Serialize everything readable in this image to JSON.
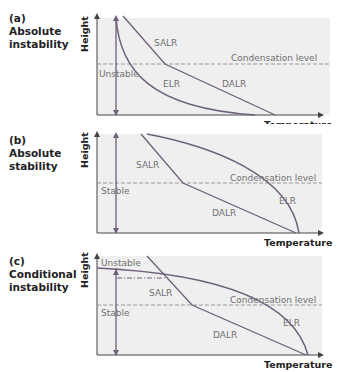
{
  "panels": [
    {
      "id": "a",
      "letter": "(a)",
      "title_line1": "Absolute",
      "title_line2": "instability",
      "region_label": "Unstable"
    },
    {
      "id": "b",
      "letter": "(b)",
      "title_line1": "Absolute",
      "title_line2": "stability",
      "region_label": "Stable"
    },
    {
      "id": "c",
      "letter": "(c)",
      "title_line1": "Conditional",
      "title_line2": "instability",
      "region_label_top": "Unstable",
      "region_label": "Stable"
    }
  ],
  "axes": {
    "y_label": "Height",
    "x_label": "Temperature"
  },
  "lines": {
    "salr": "SALR",
    "dalr": "DALR",
    "elr": "ELR",
    "condensation": "Condensation level"
  },
  "colors": {
    "line": "#6e5f7a",
    "plot_bg": "#efefef",
    "dashed": "#999999",
    "text": "#707070"
  }
}
